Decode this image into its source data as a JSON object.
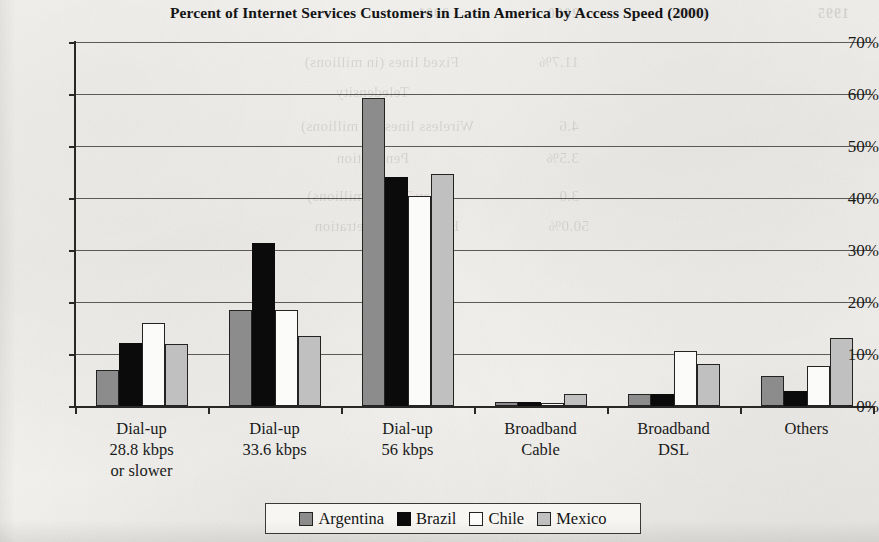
{
  "chart_data": {
    "type": "bar",
    "title": "Percent of Internet Services Customers in Latin America by Access Speed (2000)",
    "xlabel": "",
    "ylabel": "",
    "ylim": [
      0,
      70
    ],
    "ytick_step": 10,
    "ytick_labels": [
      "70%",
      "60%",
      "50%",
      "40%",
      "30%",
      "20%",
      "10%",
      "0%"
    ],
    "ytick_values": [
      70,
      60,
      50,
      40,
      30,
      20,
      10,
      0
    ],
    "grid": true,
    "grid_axis": "y",
    "legend_position": "bottom",
    "value_unit": "percent",
    "categories": [
      "Dial-up\n28.8 kbps\nor slower",
      "Dial-up\n33.6 kbps",
      "Dial-up\n56 kbps",
      "Broadband\nCable",
      "Broadband\nDSL",
      "Others"
    ],
    "category_lines": [
      [
        "Dial-up",
        "28.8 kbps",
        "or slower"
      ],
      [
        "Dial-up",
        "33.6 kbps"
      ],
      [
        "Dial-up",
        "56 kbps"
      ],
      [
        "Broadband",
        "Cable"
      ],
      [
        "Broadband",
        "DSL"
      ],
      [
        "Others"
      ]
    ],
    "series": [
      {
        "name": "Argentina",
        "color": "#8c8c8c",
        "values": [
          6.9,
          18.5,
          59.2,
          0.8,
          2.3,
          5.8
        ]
      },
      {
        "name": "Brazil",
        "color": "#0b0b0b",
        "values": [
          12.2,
          31.3,
          44.0,
          0.8,
          2.3,
          2.9
        ]
      },
      {
        "name": "Chile",
        "color": "#fbfbf9",
        "values": [
          15.9,
          18.5,
          40.4,
          0.5,
          10.5,
          7.7
        ]
      },
      {
        "name": "Mexico",
        "color": "#c0c0c0",
        "values": [
          12.0,
          13.5,
          44.6,
          2.4,
          8.0,
          13.0
        ]
      }
    ]
  },
  "legend": {
    "entries": [
      {
        "label": "Argentina"
      },
      {
        "label": "Brazil"
      },
      {
        "label": "Chile"
      },
      {
        "label": "Mexico"
      }
    ]
  },
  "bleed_through": {
    "note": "faint mirrored text showing through from the reverse side of the scanned page",
    "headers": [
      "1995",
      "1999",
      "2000",
      "2001"
    ],
    "rows": [
      "Fixed lines (in millions)",
      "Teledensity",
      "Wireless lines (in millions)",
      "Penetration",
      "Pay TV (in millions)",
      "Household penetration"
    ],
    "fragments": [
      "11.7%",
      "4.6",
      "3.5%",
      "3.0",
      "50.0%"
    ]
  }
}
